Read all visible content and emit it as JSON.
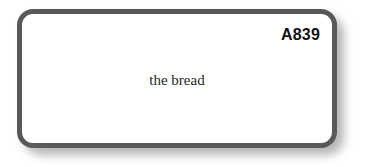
{
  "card": {
    "code_label": "A839",
    "phrase": "the bread",
    "border_color": "#595959",
    "fill_color": "#ffffff",
    "code_color": "#111111",
    "phrase_color": "#262626",
    "shadow_color": "#9a9a9a"
  },
  "page": {
    "background_color": "#ffffff"
  }
}
